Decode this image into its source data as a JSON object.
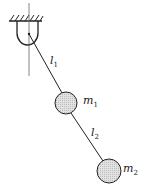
{
  "diagram": {
    "labels": {
      "l1": {
        "text": "l",
        "sub": "1"
      },
      "m1": {
        "text": "m",
        "sub": "1"
      },
      "l2": {
        "text": "l",
        "sub": "2"
      },
      "m2": {
        "text": "m",
        "sub": "2"
      }
    },
    "colors": {
      "stroke": "#222222",
      "mass_fill": "#d4d4d4"
    }
  }
}
